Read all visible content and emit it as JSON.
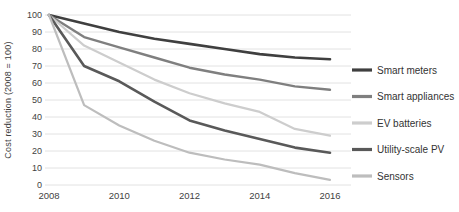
{
  "chart_data": {
    "type": "line",
    "title": "",
    "xlabel": "",
    "ylabel": "Cost reduction (2008 = 100)",
    "x": [
      2008,
      2009,
      2010,
      2011,
      2012,
      2013,
      2014,
      2015,
      2016
    ],
    "series": [
      {
        "name": "Smart meters",
        "color": "#3f3f3f",
        "width": 2.6,
        "values": [
          100,
          95,
          90,
          86,
          83,
          80,
          77,
          75,
          74
        ]
      },
      {
        "name": "Smart appliances",
        "color": "#7f7f7f",
        "width": 2.4,
        "values": [
          100,
          87,
          81,
          75,
          69,
          65,
          62,
          58,
          56
        ]
      },
      {
        "name": "EV batteries",
        "color": "#cdcdcd",
        "width": 2.2,
        "values": [
          100,
          82,
          72,
          62,
          54,
          48,
          43,
          33,
          29
        ]
      },
      {
        "name": "Utility-scale PV",
        "color": "#595959",
        "width": 2.6,
        "values": [
          100,
          70,
          61,
          49,
          38,
          32,
          27,
          22,
          19
        ]
      },
      {
        "name": "Sensors",
        "color": "#bdbdbd",
        "width": 2.2,
        "values": [
          100,
          47,
          35,
          26,
          19,
          15,
          12,
          7,
          3
        ]
      }
    ],
    "ylim": [
      0,
      100
    ],
    "yticks": [
      0,
      10,
      20,
      30,
      40,
      50,
      60,
      70,
      80,
      90,
      100
    ],
    "xticks": [
      2008,
      2010,
      2012,
      2014,
      2016
    ],
    "grid": "horizontal",
    "gridline_color": "#e2e2e2",
    "tick_label_color": "#3f3f3f",
    "legend_position": "right"
  }
}
